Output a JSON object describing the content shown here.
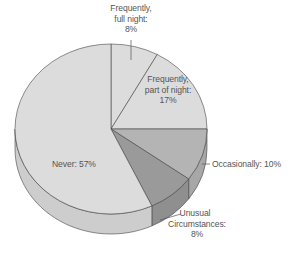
{
  "chart_data": {
    "type": "pie",
    "style": "3d-tilted",
    "title": "",
    "slices": [
      {
        "label": "Frequently, full night",
        "value": 8,
        "color": "#dcdcdc"
      },
      {
        "label": "Frequently, part of night",
        "value": 17,
        "color": "#dcdcdc"
      },
      {
        "label": "Occasionally",
        "value": 10,
        "color": "#b4b4b4"
      },
      {
        "label": "Unusual Circumstances",
        "value": 8,
        "color": "#9a9a9a"
      },
      {
        "label": "Never",
        "value": 57,
        "color": "#dcdcdc"
      }
    ],
    "categories": [
      "Frequently, full night",
      "Frequently, part of night",
      "Occasionally",
      "Unusual Circumstances",
      "Never"
    ],
    "values": [
      8,
      17,
      10,
      8,
      57
    ],
    "unit": "%",
    "legend": "none (direct labels)"
  },
  "labels": {
    "full_night": {
      "line1": "Frequently,",
      "line2": "full night:",
      "line3": "8%"
    },
    "part_night": {
      "line1": "Frequently,",
      "line2": "part of night:",
      "line3": "17%"
    },
    "occasionally": {
      "text": "Occasionally: 10%"
    },
    "unusual": {
      "line1": "Unusual",
      "line2": "Circumstances:",
      "line3": "8%"
    },
    "never": {
      "text": "Never: 57%"
    }
  }
}
